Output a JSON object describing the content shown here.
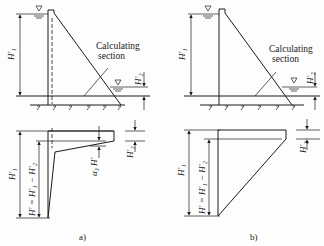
{
  "figure": {
    "panel_a": {
      "caption": "a)",
      "section_label_line1": "Calculating",
      "section_label_line2": "section",
      "upstream_head": "H′₁",
      "downstream_head": "H′₂",
      "reduced_head": "H′ = H′₁ − H′₂",
      "pressure_coefficient": "α₃ H′"
    },
    "panel_b": {
      "caption": "b)",
      "section_label_line1": "Calculating",
      "section_label_line2": "section",
      "upstream_head": "H′₁",
      "downstream_head": "H′₂",
      "reduced_head": "H′ = H′₁ − H′₂"
    },
    "water_level_symbol": "▽",
    "colors": {
      "line": "#1a1a1a",
      "background": "#fdfdfd"
    }
  }
}
